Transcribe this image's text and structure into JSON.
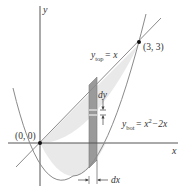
{
  "diagram": {
    "axes": {
      "x_label": "x",
      "y_label": "y"
    },
    "points": [
      {
        "label": "(0, 0)",
        "x": 0,
        "y": 0
      },
      {
        "label": "(3, 3)",
        "x": 3,
        "y": 3
      }
    ],
    "curves": {
      "top": {
        "name": "y",
        "subscript": "top",
        "equation": "= x"
      },
      "bottom": {
        "name": "y",
        "subscript": "bot",
        "equation": "= x",
        "exponent": "2",
        "tail": "−2x"
      }
    },
    "strip": {
      "dx_label": "dx",
      "dy_label": "dy"
    },
    "colors": {
      "region_fill": "#e9e9e9",
      "strip_fill": "#9a9a9a",
      "curve_stroke": "#8a8a8a",
      "axis_stroke": "#555555",
      "point_fill": "#111111"
    }
  }
}
